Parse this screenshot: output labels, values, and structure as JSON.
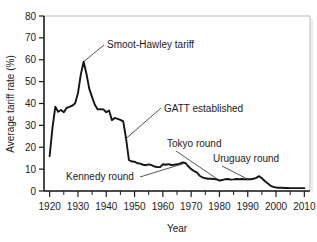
{
  "chart_data": {
    "type": "line",
    "title": "",
    "xlabel": "Year",
    "ylabel": "Average tariff rate (%)",
    "xlim": [
      1918,
      2012
    ],
    "ylim": [
      0,
      80
    ],
    "grid": false,
    "legend": "none",
    "x_ticks": [
      1920,
      1930,
      1940,
      1950,
      1960,
      1970,
      1980,
      1990,
      2000,
      2010
    ],
    "x_tick_labels": [
      "1920",
      "1930",
      "1940",
      "1950",
      "1960",
      "1970",
      "1980",
      "1990",
      "2000",
      "2010"
    ],
    "x_minor_tick_interval": 5,
    "y_ticks": [
      0,
      10,
      20,
      30,
      40,
      50,
      60,
      70,
      80
    ],
    "y_tick_labels": [
      "0",
      "10",
      "20",
      "30",
      "40",
      "50",
      "60",
      "70",
      "80"
    ],
    "series": [
      {
        "name": "Average tariff rate",
        "color": "#141414",
        "x": [
          1920,
          1921,
          1922,
          1923,
          1924,
          1925,
          1926,
          1927,
          1928,
          1929,
          1930,
          1931,
          1932,
          1933,
          1934,
          1935,
          1936,
          1937,
          1938,
          1939,
          1940,
          1941,
          1942,
          1943,
          1944,
          1945,
          1946,
          1947,
          1948,
          1949,
          1950,
          1951,
          1952,
          1953,
          1954,
          1955,
          1956,
          1957,
          1958,
          1959,
          1960,
          1961,
          1962,
          1963,
          1964,
          1965,
          1966,
          1967,
          1968,
          1969,
          1970,
          1971,
          1972,
          1973,
          1974,
          1975,
          1976,
          1977,
          1978,
          1979,
          1980,
          1981,
          1982,
          1983,
          1984,
          1985,
          1986,
          1987,
          1988,
          1989,
          1990,
          1991,
          1992,
          1993,
          1994,
          1995,
          1996,
          1997,
          1998,
          1999,
          2000,
          2001,
          2002,
          2003,
          2004,
          2005,
          2006,
          2007,
          2008,
          2009,
          2010
        ],
        "y": [
          16.0,
          29.0,
          38.5,
          36.2,
          37.0,
          36.0,
          38.0,
          38.5,
          39.0,
          40.1,
          44.7,
          53.2,
          59.1,
          53.6,
          46.7,
          42.9,
          39.3,
          37.3,
          37.4,
          37.3,
          36.0,
          36.8,
          32.4,
          33.4,
          33.0,
          32.5,
          31.8,
          24.0,
          14.2,
          13.5,
          13.4,
          12.7,
          12.5,
          12.0,
          11.8,
          12.2,
          11.8,
          11.2,
          11.0,
          10.9,
          12.2,
          12.0,
          12.3,
          11.9,
          12.0,
          12.2,
          12.5,
          13.1,
          12.8,
          11.3,
          10.0,
          9.1,
          8.5,
          7.0,
          6.2,
          5.8,
          5.6,
          5.6,
          5.5,
          5.3,
          4.8,
          5.0,
          5.4,
          5.5,
          5.2,
          5.3,
          5.5,
          5.4,
          5.5,
          5.3,
          5.4,
          5.4,
          5.6,
          6.0,
          6.8,
          5.8,
          4.6,
          3.5,
          2.5,
          1.9,
          1.6,
          1.5,
          1.5,
          1.4,
          1.4,
          1.3,
          1.3,
          1.3,
          1.3,
          1.3,
          1.3
        ]
      }
    ],
    "annotations": [
      {
        "id": "smoot-hawley",
        "label": "Smoot-Hawley tariff",
        "points_to_year": 1932,
        "points_to_value": 59.1
      },
      {
        "id": "gatt-established",
        "label": "GATT established",
        "points_to_year": 1947,
        "points_to_value": 24.0
      },
      {
        "id": "kennedy-round",
        "label": "Kennedy round",
        "points_to_year": 1968,
        "points_to_value": 12.8
      },
      {
        "id": "tokyo-round",
        "label": "Tokyo round",
        "points_to_year": 1980,
        "points_to_value": 4.8
      },
      {
        "id": "uruguay-round",
        "label": "Uruguay round",
        "points_to_year": 1990,
        "points_to_value": 5.4
      }
    ]
  }
}
